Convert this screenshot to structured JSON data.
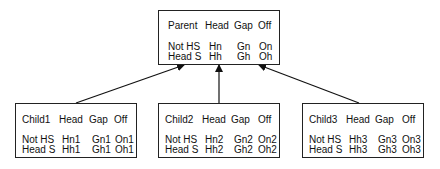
{
  "parent": {
    "header": [
      "Parent",
      "Head",
      "Gap",
      "Off"
    ],
    "rows": [
      [
        "Not HS",
        "Hn",
        "Gn",
        "On"
      ],
      [
        "Head S",
        "Hh",
        "Gh",
        "Oh"
      ]
    ]
  },
  "children": [
    {
      "header": [
        "Child1",
        "Head",
        "Gap",
        "Off"
      ],
      "rows": [
        [
          "Not HS",
          "Hn1",
          "Gn1",
          "On1"
        ],
        [
          "Head S",
          "Hh1",
          "Gh1",
          "Oh1"
        ]
      ]
    },
    {
      "header": [
        "Child2",
        "Head",
        "Gap",
        "Off"
      ],
      "rows": [
        [
          "Not HS",
          "Hn2",
          "Gn2",
          "On2"
        ],
        [
          "Head S",
          "Hh2",
          "Gh2",
          "Oh2"
        ]
      ]
    },
    {
      "header": [
        "Child3",
        "Head",
        "Gap",
        "Off"
      ],
      "rows": [
        [
          "Not HS",
          "Hh3",
          "Gn3",
          "On3"
        ],
        [
          "Head S",
          "Hh3",
          "Gh3",
          "Oh3"
        ]
      ]
    }
  ],
  "edges": [
    {
      "from": "Child1",
      "to": "Parent"
    },
    {
      "from": "Child2",
      "to": "Parent"
    },
    {
      "from": "Child3",
      "to": "Parent"
    }
  ]
}
